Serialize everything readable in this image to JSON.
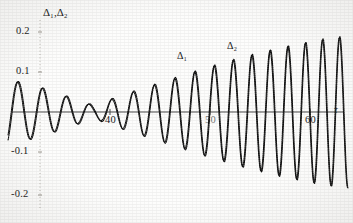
{
  "chart_data": {
    "type": "line",
    "title": "",
    "ylabel": "Δ₁,Δ₂",
    "xlabel": "τ",
    "xlim": [
      34,
      66
    ],
    "ylim": [
      -0.24,
      0.235
    ],
    "grid": false,
    "legend_position": "inline-annotations",
    "xticks": [
      40,
      50,
      60
    ],
    "xticklabels": [
      "40",
      "50",
      "60"
    ],
    "yticks": [
      0.2,
      0.1,
      -0.1,
      -0.2
    ],
    "yticklabels": [
      "0.2",
      "0.1",
      "-0.1",
      "-0.2"
    ],
    "zero_line": 0,
    "annotations": [
      {
        "text": "Δ₁",
        "x": 47.5,
        "y": 0.132
      },
      {
        "text": "Δ₂",
        "x": 52.5,
        "y": 0.158
      }
    ],
    "series": [
      {
        "name": "Δ₁",
        "color": "#111111",
        "style": "dotted",
        "description": "Rapidly oscillating beat-modulated signal; envelope starts near 0.10 at tau=34, collapses to a node near tau=44, then grows to about 0.20 by tau=66; oscillation frequency increases with tau.",
        "envelope_nodes": [
          {
            "x": 34,
            "amp": 0.103
          },
          {
            "x": 37,
            "amp": 0.088
          },
          {
            "x": 40,
            "amp": 0.063
          },
          {
            "x": 42,
            "amp": 0.04
          },
          {
            "x": 44,
            "amp": 0.017
          },
          {
            "x": 46,
            "amp": 0.042
          },
          {
            "x": 49,
            "amp": 0.075
          },
          {
            "x": 52,
            "amp": 0.108
          },
          {
            "x": 55,
            "amp": 0.138
          },
          {
            "x": 58,
            "amp": 0.163
          },
          {
            "x": 61,
            "amp": 0.183
          },
          {
            "x": 64,
            "amp": 0.196
          },
          {
            "x": 66,
            "amp": 0.202
          }
        ],
        "phase_offset": 0.0,
        "freq_start": 3.05,
        "freq_end": 5.35
      },
      {
        "name": "Δ₂",
        "color": "#111111",
        "style": "dotted",
        "description": "Second signal nearly coincident with the first, drawn slightly out of phase so the two traces overlap into a single thick dotted band.",
        "envelope_nodes": [
          {
            "x": 34,
            "amp": 0.1
          },
          {
            "x": 37,
            "amp": 0.086
          },
          {
            "x": 40,
            "amp": 0.061
          },
          {
            "x": 42,
            "amp": 0.038
          },
          {
            "x": 44,
            "amp": 0.015
          },
          {
            "x": 46,
            "amp": 0.04
          },
          {
            "x": 49,
            "amp": 0.073
          },
          {
            "x": 52,
            "amp": 0.106
          },
          {
            "x": 55,
            "amp": 0.136
          },
          {
            "x": 58,
            "amp": 0.161
          },
          {
            "x": 61,
            "amp": 0.181
          },
          {
            "x": 64,
            "amp": 0.194
          },
          {
            "x": 66,
            "amp": 0.2
          }
        ],
        "phase_offset": 0.22,
        "freq_start": 3.05,
        "freq_end": 5.35
      }
    ]
  },
  "axis": {
    "y_title": "Δ₁,Δ₂",
    "x_title": "τ",
    "yticks": [
      "0.2",
      "0.1",
      "-0.1",
      "-0.2"
    ],
    "xticks": [
      "40",
      "50",
      "60"
    ]
  },
  "curve_labels": {
    "first": "Δ₁",
    "second": "Δ₂"
  }
}
